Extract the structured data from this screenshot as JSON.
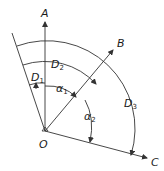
{
  "diagram": {
    "labels": {
      "A": "A",
      "B": "B",
      "C": "C",
      "O": "O",
      "D1": "D",
      "D1_sub": "1",
      "D2": "D",
      "D2_sub": "2",
      "D3": "D",
      "D3_sub": "3",
      "alpha1": "α",
      "alpha1_sub": "1",
      "alpha2": "α",
      "alpha2_sub": "2"
    }
  }
}
